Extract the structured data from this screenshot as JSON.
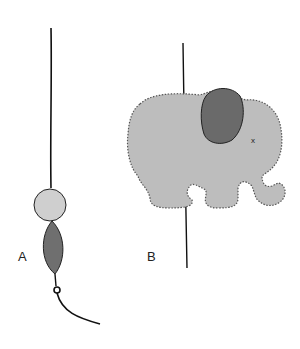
{
  "figure": {
    "type": "craft-illustration",
    "panels": [
      {
        "id": "A",
        "label": "A",
        "description": "Hanging string with round light-gray bead and dark-gray leaf-shaped bead, knot and loose tail"
      },
      {
        "id": "B",
        "label": "B",
        "description": "Gray felt elephant with blanket-stitched edges and darker ear, threaded on vertical string"
      }
    ],
    "colors": {
      "line": "#111111",
      "round_bead": "#cfcfcf",
      "leaf_bead": "#6f6f6f",
      "elephant_body": "#bdbdbd",
      "elephant_ear": "#6a6a6a",
      "background": "#ffffff"
    },
    "elephant_eye_mark": "x"
  }
}
